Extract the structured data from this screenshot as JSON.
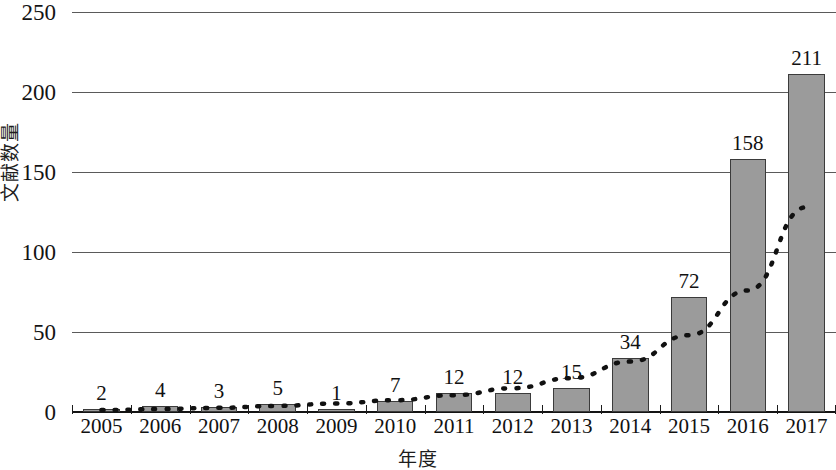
{
  "chart_data": {
    "type": "bar",
    "title": "",
    "subtitle": "",
    "xlabel": "年度",
    "ylabel": "文献数量",
    "categories": [
      "2005",
      "2006",
      "2007",
      "2008",
      "2009",
      "2010",
      "2011",
      "2012",
      "2013",
      "2014",
      "2015",
      "2016",
      "2017"
    ],
    "values": [
      2,
      4,
      3,
      5,
      1,
      7,
      12,
      12,
      15,
      34,
      72,
      158,
      211
    ],
    "data_labels": [
      "2",
      "4",
      "3",
      "5",
      "1",
      "7",
      "12",
      "12",
      "15",
      "34",
      "72",
      "158",
      "211"
    ],
    "ylim": [
      0,
      250
    ],
    "ytick_labels": [
      "250",
      "200",
      "150",
      "100",
      "50",
      "0"
    ],
    "ytick_values": [
      250,
      200,
      150,
      100,
      50,
      0
    ],
    "ytick_step": 50,
    "grid": true,
    "grid_axis": "y",
    "legend": "none",
    "series": [
      {
        "name": "文献数量",
        "type": "bar",
        "values": [
          2,
          4,
          3,
          5,
          1,
          7,
          12,
          12,
          15,
          34,
          72,
          158,
          211
        ],
        "bar_fill": "#9b9b9b",
        "bar_edge": "#3b3b3b"
      },
      {
        "name": "trendline",
        "type": "line",
        "style": "dotted",
        "color": "#111111",
        "values": [
          1.2,
          1.8,
          2.6,
          3.8,
          5.3,
          7.4,
          10.5,
          14.9,
          21.2,
          31.5,
          48.0,
          76.0,
          128.0
        ]
      }
    ],
    "axis_color": "#141414",
    "gridline_color": "#5a5a5a",
    "background": "#ffffff"
  }
}
